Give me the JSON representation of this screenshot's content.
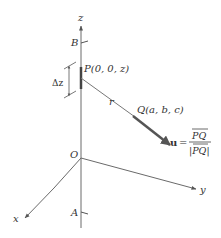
{
  "figure": {
    "axes": {
      "z_label": "z",
      "x_label": "x",
      "y_label": "y",
      "origin_label": "O"
    },
    "points": {
      "B": "B",
      "A": "A",
      "P": "P(0, 0, z)",
      "Q": "Q(a, b, c)"
    },
    "labels": {
      "delta_z": "Δz",
      "r": "r",
      "unit_vector_symbol": "u",
      "equals": "=",
      "numerator": "PQ",
      "denominator": "|PQ|"
    },
    "colors": {
      "axis": "#6a6a6a",
      "line": "#777777",
      "vector": "#555555",
      "text": "#333333"
    }
  }
}
